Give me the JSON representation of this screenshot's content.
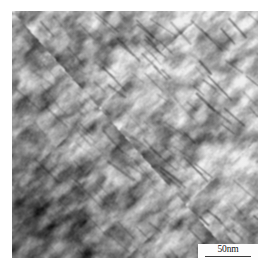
{
  "figure": {
    "type": "micrograph",
    "modality": "transmission-electron-micrograph",
    "alt": "Grayscale TEM micrograph of a mottled nanostructured surface with dark diagonal lamellar streaks",
    "panel": {
      "x": 12,
      "y": 11,
      "width": 246,
      "height": 247
    },
    "background_color": "#ffffff"
  },
  "scalebar": {
    "label": "50nm",
    "value": 50,
    "unit": "nm",
    "bar_color": "#3a3a3a",
    "text_color": "#141414",
    "box_color": "#fdfdfd",
    "box": {
      "x": 198,
      "y": 244,
      "width": 60,
      "height": 16
    },
    "bar_length_px": 46
  },
  "image_appearance": {
    "palette": "grayscale",
    "min_gray": "#0d0d0d",
    "max_gray": "#f4f4f4",
    "mean_gray": "#8a8a8a",
    "gradient_description": "dark at lower-left and left edge, brightening toward the upper-right corner",
    "gradient_bright_corner": "top-right",
    "gradient_dark_corner": "bottom-left",
    "texture_description": "fine mottled grain contrast overlaid with sharp dark diagonal lamellae",
    "streak_angle_deg": -42,
    "streak_color": "#141414",
    "grain_scale_px": 16,
    "noise_amount": 0.1
  },
  "render_params": {
    "seed": 20240517,
    "octaves": 5,
    "base_frequency": 0.055,
    "streak_count": 170,
    "streak_min_len": 10,
    "streak_max_len": 34,
    "streak_thickness": 1.7
  }
}
